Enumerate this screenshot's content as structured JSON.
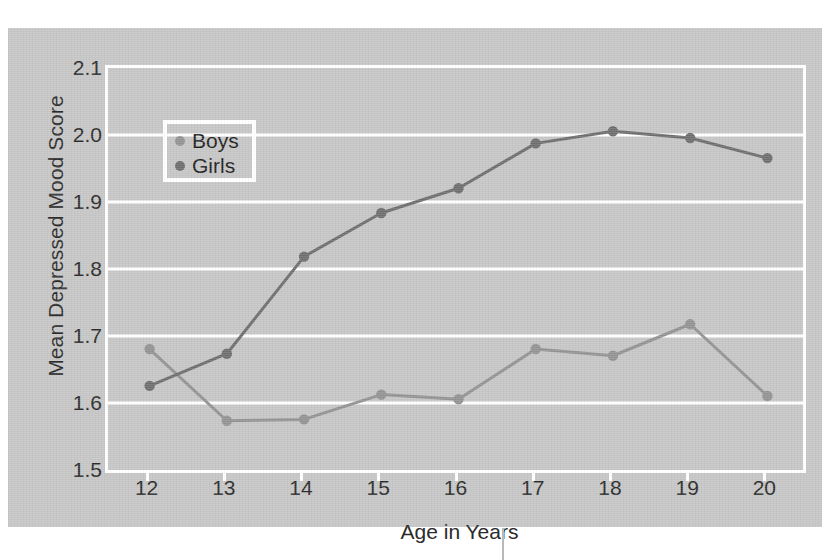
{
  "figure": {
    "panel_color": "#c6c6c6",
    "plot_border_color": "#ffffff",
    "gridline_color": "#ffffff"
  },
  "legend": {
    "entries": [
      {
        "label": "Boys",
        "color": "#939393",
        "marker": "circle-marker"
      },
      {
        "label": "Girls",
        "color": "#6e6e6e",
        "marker": "circle-marker"
      }
    ]
  },
  "axes": {
    "y_title": "Mean Depressed Mood Score",
    "x_title": "Age in Years",
    "y_ticks": [
      "1.5",
      "1.6",
      "1.7",
      "1.8",
      "1.9",
      "2.0",
      "2.1"
    ],
    "x_ticks": [
      "12",
      "13",
      "14",
      "15",
      "16",
      "17",
      "18",
      "19",
      "20"
    ]
  },
  "chart_data": {
    "type": "line",
    "title": "",
    "xlabel": "Age in Years",
    "ylabel": "Mean Depressed Mood Score",
    "x": [
      12,
      13,
      14,
      15,
      16,
      17,
      18,
      19,
      20
    ],
    "xlim": [
      11.5,
      20.5
    ],
    "ylim": [
      1.5,
      2.1
    ],
    "xticks": [
      12,
      13,
      14,
      15,
      16,
      17,
      18,
      19,
      20
    ],
    "yticks": [
      1.5,
      1.6,
      1.7,
      1.8,
      1.9,
      2.0,
      2.1
    ],
    "grid": "horizontal",
    "legend_position": "upper-left-inside",
    "series": [
      {
        "name": "Boys",
        "color": "#939393",
        "values": [
          1.685,
          1.578,
          1.58,
          1.617,
          1.61,
          1.685,
          1.675,
          1.722,
          1.615
        ]
      },
      {
        "name": "Girls",
        "color": "#6e6e6e",
        "values": [
          1.63,
          1.678,
          1.823,
          1.888,
          1.925,
          1.992,
          2.01,
          2.0,
          1.97
        ]
      }
    ]
  }
}
